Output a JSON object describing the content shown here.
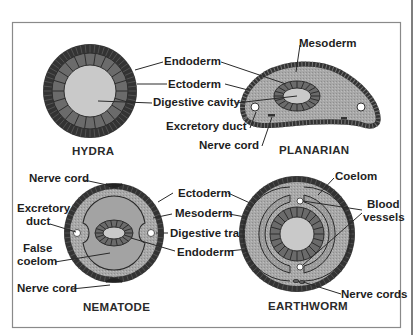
{
  "figure": {
    "colors": {
      "ectoderm": "#333333",
      "endoderm": "#6b6b6b",
      "mesoderm": "#a6a6a6",
      "cavity": "#c9c9c9",
      "frame": "#8a8a8a",
      "text": "#1e1e1e"
    },
    "organisms": [
      {
        "name": "HYDRA",
        "labels": [
          "Endoderm",
          "Ectoderm",
          "Digestive cavity"
        ]
      },
      {
        "name": "PLANARIAN",
        "labels": [
          "Mesoderm",
          "Excretory duct",
          "Nerve cord"
        ]
      },
      {
        "name": "NEMATODE",
        "labels": [
          "Nerve cord",
          "Excretory",
          "duct",
          "False",
          "coelom",
          "Nerve cord"
        ]
      },
      {
        "name": "EARTHWORM",
        "labels": [
          "Coelom",
          "Blood",
          "vessels",
          "Nerve cords"
        ]
      }
    ],
    "shared_labels": {
      "top": [
        "Endoderm",
        "Ectoderm",
        "Digestive cavity"
      ],
      "bottom": [
        "Ectoderm",
        "Mesoderm",
        "Digestive tract",
        "Endoderm"
      ]
    }
  }
}
